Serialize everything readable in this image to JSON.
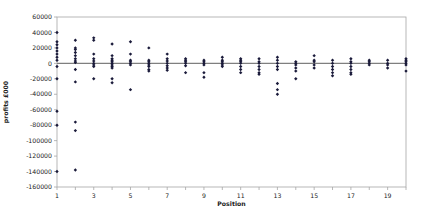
{
  "chart_data": {
    "type": "scatter",
    "title": "",
    "xlabel": "Position",
    "ylabel": "profits £000",
    "xlim": [
      1,
      20
    ],
    "ylim": [
      -160000,
      60000
    ],
    "x_ticks": [
      1,
      3,
      5,
      7,
      9,
      11,
      13,
      15,
      17,
      19
    ],
    "y_ticks": [
      60000,
      40000,
      20000,
      0,
      -20000,
      -40000,
      -60000,
      -80000,
      -100000,
      -120000,
      -140000,
      -160000
    ],
    "grid": false,
    "legend": null,
    "marker": "diamond",
    "marker_color": "#1a1a3a",
    "zero_line_color": "#7f7f7f",
    "frame_color": "#a6a6a6",
    "points": [
      {
        "x": 1,
        "y": [
          40000,
          28000,
          24000,
          20000,
          16000,
          12000,
          8000,
          4000,
          -4000,
          -20000,
          -62000,
          -80000,
          -140000
        ]
      },
      {
        "x": 2,
        "y": [
          30000,
          20000,
          18000,
          14000,
          10000,
          6000,
          3000,
          1000,
          -8000,
          -24000,
          -76000,
          -87000,
          -138000
        ]
      },
      {
        "x": 3,
        "y": [
          33000,
          30000,
          12000,
          6000,
          3000,
          0,
          -2000,
          -4000,
          -20000
        ]
      },
      {
        "x": 4,
        "y": [
          25000,
          10000,
          6000,
          4000,
          2000,
          0,
          -2000,
          -4000,
          -6000,
          -20000,
          -25000
        ]
      },
      {
        "x": 5,
        "y": [
          28000,
          12000,
          4000,
          2000,
          0,
          -2000,
          -34000
        ]
      },
      {
        "x": 6,
        "y": [
          20000,
          4000,
          2000,
          0,
          -2000,
          -4000,
          -8000,
          -10000
        ]
      },
      {
        "x": 7,
        "y": [
          12000,
          6000,
          3000,
          0,
          -3000,
          -6000,
          -9000
        ]
      },
      {
        "x": 8,
        "y": [
          6000,
          4000,
          2000,
          0,
          -3000,
          -12000
        ]
      },
      {
        "x": 9,
        "y": [
          4000,
          2000,
          0,
          -2000,
          -12000,
          -18000
        ]
      },
      {
        "x": 10,
        "y": [
          8000,
          4000,
          2000,
          0,
          -2000,
          -4000
        ]
      },
      {
        "x": 11,
        "y": [
          6000,
          4000,
          2000,
          0,
          -4000,
          -8000,
          -12000
        ]
      },
      {
        "x": 12,
        "y": [
          6000,
          2000,
          0,
          -4000,
          -8000,
          -12000,
          -14000
        ]
      },
      {
        "x": 13,
        "y": [
          8000,
          4000,
          0,
          -4000,
          -8000,
          -26000,
          -34000,
          -40000
        ]
      },
      {
        "x": 14,
        "y": [
          2000,
          0,
          -2000,
          -6000,
          -10000,
          -20000
        ]
      },
      {
        "x": 15,
        "y": [
          10000,
          4000,
          2000,
          -2000,
          -6000
        ]
      },
      {
        "x": 16,
        "y": [
          4000,
          0,
          -4000,
          -8000,
          -12000,
          -16000
        ]
      },
      {
        "x": 17,
        "y": [
          6000,
          2000,
          0,
          -4000,
          -8000,
          -12000,
          -14000
        ]
      },
      {
        "x": 18,
        "y": [
          4000,
          2000,
          0,
          -2000
        ]
      },
      {
        "x": 19,
        "y": [
          4000,
          0,
          -2000,
          -6000
        ]
      },
      {
        "x": 20,
        "y": [
          6000,
          4000,
          2000,
          0,
          -2000,
          -10000
        ]
      }
    ]
  },
  "layout": {
    "plot_left": 57,
    "plot_right": 406,
    "plot_top": 17,
    "plot_bottom": 187
  }
}
